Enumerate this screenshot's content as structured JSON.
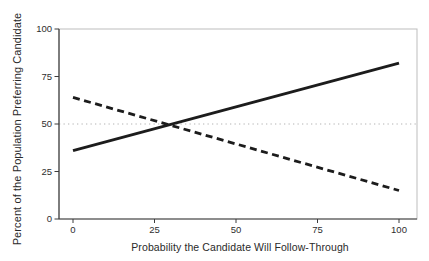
{
  "figure": {
    "background": "#ffffff"
  },
  "chart_data": {
    "type": "line",
    "title": "",
    "xlabel": "Probability the Candidate Will Follow-Through",
    "ylabel": "Percent of the Population Preferring Candidate",
    "xlim": [
      0,
      100
    ],
    "ylim": [
      0,
      100
    ],
    "xticks": [
      "0",
      "25",
      "50",
      "75",
      "100"
    ],
    "yticks": [
      "0",
      "25",
      "50",
      "75",
      "100"
    ],
    "grid": false,
    "legend": "none",
    "series": [
      {
        "name": "solid-line",
        "style": "solid",
        "color": "#1c1c1c",
        "width": 2.8,
        "x": [
          0,
          100
        ],
        "y": [
          36,
          82
        ]
      },
      {
        "name": "dashed-line",
        "style": "dashed",
        "color": "#1c1c1c",
        "width": 2.8,
        "x": [
          0,
          100
        ],
        "y": [
          64,
          15
        ]
      }
    ],
    "reference_lines": [
      {
        "axis": "y",
        "value": 50,
        "style": "dotted",
        "color": "#b4b4b4",
        "width": 1.2
      }
    ],
    "colors": {
      "axis": "#3c3c3c",
      "panel_border": "#bdbdbd",
      "tick_label": "#2e2e2e"
    }
  }
}
